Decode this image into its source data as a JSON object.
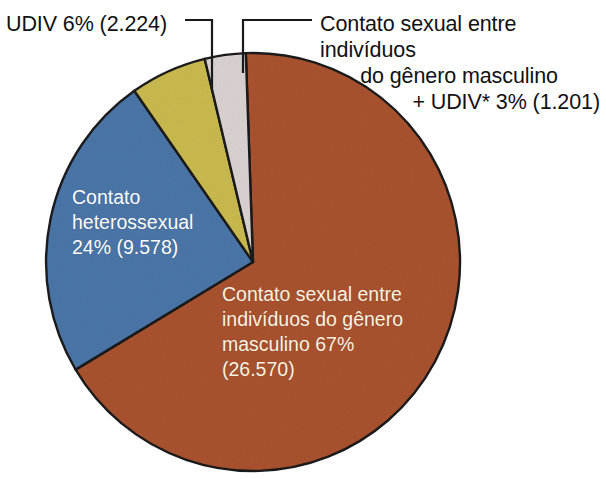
{
  "chart_data": {
    "type": "pie",
    "title": "",
    "subtitle": "",
    "xlabel": "",
    "ylabel": "",
    "legend_position": "none",
    "grid": false,
    "total_cases": 39573,
    "units": "casos",
    "categories": [
      "Contato sexual entre indivíduos do gênero masculino",
      "Contato heterossexual",
      "UDIV",
      "Contato sexual entre indivíduos do gênero masculino + UDIV*"
    ],
    "values": [
      67,
      24,
      6,
      3
    ],
    "counts": [
      26570,
      9578,
      2224,
      1201
    ],
    "counts_text": [
      "26.570",
      "9.578",
      "2.224",
      "1.201"
    ],
    "percent_text": [
      "67%",
      "24%",
      "6%",
      "3%"
    ],
    "colors": [
      "#a9522f",
      "#4b76a8",
      "#c9ba4f",
      "#d9d2d1"
    ],
    "slices": [
      {
        "name": "contato-sexual-masculino",
        "label": "Contato sexual entre indivíduos do gênero masculino",
        "percent": 67,
        "percent_text": "67%",
        "count": 26570,
        "count_text": "(26.570)",
        "color": "#a9522f",
        "start_angle": -2,
        "end_angle": 239,
        "label_placement": "inside"
      },
      {
        "name": "contato-heterossexual",
        "label": "Contato heterossexual",
        "percent": 24,
        "percent_text": "24%",
        "count": 9578,
        "count_text": "(9.578)",
        "color": "#4b76a8",
        "start_angle": 239,
        "end_angle": 325,
        "label_placement": "inside"
      },
      {
        "name": "udiv",
        "label": "UDIV",
        "percent": 6,
        "percent_text": "6%",
        "count": 2224,
        "count_text": "(2.224)",
        "color": "#c9ba4f",
        "start_angle": 325,
        "end_angle": 346.5,
        "label_placement": "callout-left"
      },
      {
        "name": "contato-sexual-masculino-udiv",
        "label": "Contato sexual entre indivíduos do gênero masculino + UDIV*",
        "percent": 3,
        "percent_text": "3%",
        "count": 1201,
        "count_text": "(1.201)",
        "color": "#d9d2d1",
        "start_angle": 346.5,
        "end_angle": 358,
        "label_placement": "callout-right"
      }
    ]
  },
  "callouts": {
    "udiv": {
      "text": "UDIV 6% (2.224)"
    },
    "msm_udiv": {
      "line1": "Contato sexual entre indivíduos",
      "line2": "do gênero masculino",
      "line3": "+ UDIV* 3% (1.201)"
    }
  },
  "slice_labels": {
    "heterossexual": "Contato\nheterossexual\n24% (9.578)",
    "masculino": "Contato sexual entre\nindivíduos do gênero\nmasculino 67%\n(26.570)"
  },
  "style": {
    "background": "#ffffff",
    "outline": "#1a1a1a",
    "callout_text_color": "#111111",
    "inside_label_color": "#ffffff",
    "brown_label_color": "#fdf3e2"
  }
}
